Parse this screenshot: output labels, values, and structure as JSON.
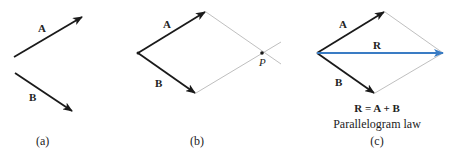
{
  "colors": {
    "vector": "#1a1a1a",
    "construction": "#b8b8b8",
    "resultant": "#3a7cc4"
  },
  "panels": [
    {
      "id": "a",
      "caption": "(a)",
      "vectors": [
        {
          "label": "A",
          "from": [
            14,
            57
          ],
          "to": [
            82,
            17
          ]
        },
        {
          "label": "B",
          "from": [
            15,
            73
          ],
          "to": [
            72,
            111
          ]
        }
      ]
    },
    {
      "id": "b",
      "caption": "(b)",
      "point_label": "P",
      "vectors": [
        {
          "label": "A",
          "from": [
            138,
            53
          ],
          "to": [
            205,
            12
          ]
        },
        {
          "label": "B",
          "from": [
            138,
            53
          ],
          "to": [
            195,
            93
          ]
        }
      ]
    },
    {
      "id": "c",
      "caption": "(c)",
      "equation": "R = A + B",
      "law": "Parallelogram law",
      "vectors": [
        {
          "label": "A",
          "from": [
            317,
            53
          ],
          "to": [
            384,
            12
          ]
        },
        {
          "label": "B",
          "from": [
            317,
            53
          ],
          "to": [
            374,
            93
          ]
        },
        {
          "label": "R",
          "from": [
            317,
            53
          ],
          "to": [
            443,
            53
          ]
        }
      ]
    }
  ]
}
